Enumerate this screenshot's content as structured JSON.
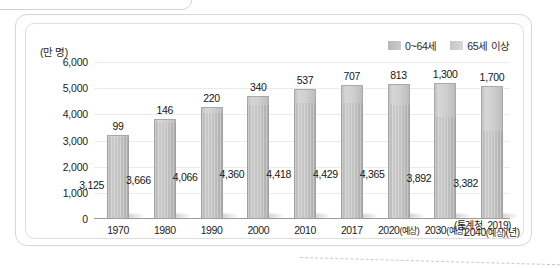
{
  "chart_data": {
    "type": "bar",
    "subtype": "stacked-bar",
    "title": "",
    "xlabel": "(년)",
    "ylabel": "(만 명)",
    "ylim": [
      0,
      6000
    ],
    "yticks": [
      "0",
      "1,000",
      "2,000",
      "3,000",
      "4,000",
      "5,000",
      "6,000"
    ],
    "ytick_values": [
      0,
      1000,
      2000,
      3000,
      4000,
      5000,
      6000
    ],
    "grid": true,
    "legend_position": "top-right",
    "categories": [
      "1970",
      "1980",
      "1990",
      "2000",
      "2010",
      "2017",
      "2020(예상)",
      "2030(예상)",
      "2040(예상)"
    ],
    "category_labels": [
      {
        "year": "1970",
        "note": ""
      },
      {
        "year": "1980",
        "note": ""
      },
      {
        "year": "1990",
        "note": ""
      },
      {
        "year": "2000",
        "note": ""
      },
      {
        "year": "2010",
        "note": ""
      },
      {
        "year": "2017",
        "note": ""
      },
      {
        "year": "2020",
        "note": "(예상)"
      },
      {
        "year": "2030",
        "note": "(예상)"
      },
      {
        "year": "2040",
        "note": "(예상)"
      }
    ],
    "series": [
      {
        "name": "0~64세",
        "color": "#c0c0c0",
        "values": [
          3125,
          3666,
          4066,
          4360,
          4418,
          4429,
          4365,
          3892,
          3382
        ],
        "labels": [
          "3,125",
          "3,666",
          "4,066",
          "4,360",
          "4,418",
          "4,429",
          "4,365",
          "3,892",
          "3,382"
        ]
      },
      {
        "name": "65세 이상",
        "color": "#cfcfcf",
        "values": [
          99,
          146,
          220,
          340,
          537,
          707,
          813,
          1300,
          1700
        ],
        "labels": [
          "99",
          "146",
          "220",
          "340",
          "537",
          "707",
          "813",
          "1,300",
          "1,700"
        ]
      }
    ],
    "source": "(통계청, 2019)"
  },
  "legend": {
    "items": [
      {
        "label": "0~64세",
        "color": "#c4c4c4"
      },
      {
        "label": "65세 이상",
        "color": "#d0d0d0"
      }
    ]
  },
  "axis": {
    "y_unit": "(만 명)",
    "x_unit": "(년)"
  },
  "footer": {
    "source": "(통계청, 2019)"
  }
}
